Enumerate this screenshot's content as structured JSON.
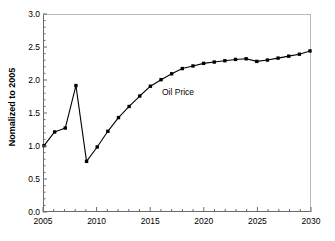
{
  "chart_data": {
    "type": "line",
    "title": "",
    "xlabel": "",
    "ylabel": "Nomalized to 2005",
    "xlim": [
      2005,
      2030
    ],
    "ylim": [
      0.0,
      3.0
    ],
    "yticks": [
      0.0,
      0.5,
      1.0,
      1.5,
      2.0,
      2.5,
      3.0
    ],
    "ytick_labels": [
      "0.0",
      "0.5",
      "1.0",
      "1.5",
      "2.0",
      "2.5",
      "3.0"
    ],
    "xticks": [
      2005,
      2010,
      2015,
      2020,
      2025,
      2030
    ],
    "xtick_labels": [
      "2005",
      "2010",
      "2015",
      "2020",
      "2025",
      "2030"
    ],
    "x_minor_tick_step": 1,
    "grid": false,
    "legend_position": "none",
    "marker": "filled-square",
    "line_color": "#000000",
    "marker_color": "#000000",
    "annotations": [
      {
        "text": "Oil Price",
        "x": 2016.1,
        "y": 1.82
      }
    ],
    "series": [
      {
        "name": "Oil Price",
        "x": [
          2005,
          2006,
          2007,
          2008,
          2009,
          2010,
          2011,
          2012,
          2013,
          2014,
          2015,
          2016,
          2017,
          2018,
          2019,
          2020,
          2021,
          2022,
          2023,
          2024,
          2025,
          2026,
          2027,
          2028,
          2029,
          2030
        ],
        "values": [
          1.0,
          1.21,
          1.27,
          1.92,
          0.76,
          0.98,
          1.22,
          1.43,
          1.6,
          1.76,
          1.91,
          2.01,
          2.1,
          2.18,
          2.22,
          2.26,
          2.28,
          2.3,
          2.32,
          2.33,
          2.29,
          2.31,
          2.34,
          2.37,
          2.4,
          2.45
        ]
      }
    ]
  },
  "axes": {
    "y_title": "Nomalized to 2005"
  }
}
